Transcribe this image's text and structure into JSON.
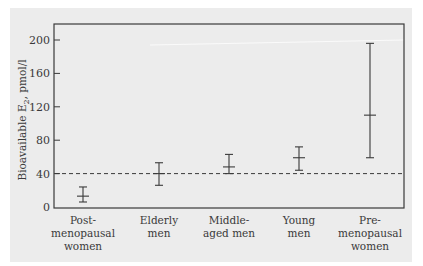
{
  "chart_data": {
    "type": "errorbar",
    "title": "",
    "xlabel": "",
    "ylabel": "Bioavailable E2, pmol/l",
    "ylabel_parts": {
      "main": "Bioavailable E",
      "sub": "2",
      "rest": ", pmol/l"
    },
    "ylim": [
      0,
      200
    ],
    "yticks": [
      0,
      40,
      80,
      120,
      160,
      200
    ],
    "grid": false,
    "legend": null,
    "categories": [
      [
        "Post-",
        "menopausal",
        "women"
      ],
      [
        "Elderly",
        "men"
      ],
      [
        "Middle-",
        "aged men"
      ],
      [
        "Young",
        "men"
      ],
      [
        "Pre-",
        "menopausal",
        "women"
      ]
    ],
    "category_names": [
      "Post-menopausal women",
      "Elderly men",
      "Middle-aged men",
      "Young men",
      "Pre-menopausal women"
    ],
    "series": [
      {
        "name": "Bioavailable E2",
        "mean": [
          13,
          40,
          48,
          59,
          110
        ],
        "lower": [
          6,
          26,
          40,
          44,
          59
        ],
        "upper": [
          24,
          53,
          63,
          72,
          196
        ]
      }
    ],
    "reference_line": {
      "y": 40,
      "style": "dashed"
    }
  },
  "colors": {
    "panel_bg": "#ececec",
    "axis": "#3a3a3a",
    "bar": "#3a3a3a"
  }
}
